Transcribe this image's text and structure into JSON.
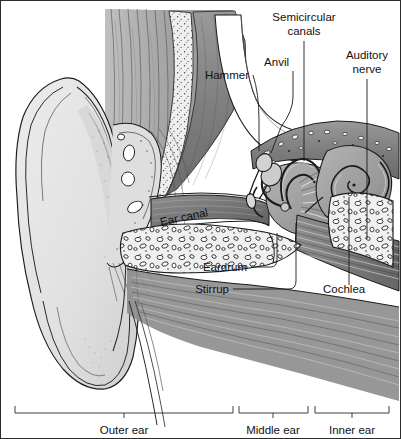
{
  "figure": {
    "background_color": "#ffffff",
    "border_color": "#2b2b2b",
    "ink_color": "#1b1b1b",
    "width": 401,
    "height": 439
  },
  "labels": [
    {
      "id": "hammer",
      "text": "Hammer",
      "x": 248,
      "y": 78,
      "anchor": "end"
    },
    {
      "id": "anvil",
      "text": "Anvil",
      "x": 288,
      "y": 65,
      "anchor": "end"
    },
    {
      "id": "semicircular_line1",
      "text": "Semicircular",
      "x": 303,
      "y": 20,
      "anchor": "middle"
    },
    {
      "id": "semicircular_line2",
      "text": "canals",
      "x": 303,
      "y": 34,
      "anchor": "middle"
    },
    {
      "id": "auditory_line1",
      "text": "Auditory",
      "x": 366,
      "y": 58,
      "anchor": "middle"
    },
    {
      "id": "auditory_line2",
      "text": "nerve",
      "x": 366,
      "y": 72,
      "anchor": "middle"
    },
    {
      "id": "ear_canal",
      "text": "Ear canal",
      "x": 160,
      "y": 225,
      "anchor": "start",
      "rotate": -12
    },
    {
      "id": "eardrum",
      "text": "Eardrum",
      "x": 246,
      "y": 270,
      "anchor": "end"
    },
    {
      "id": "stirrup",
      "text": "Stirrup",
      "x": 228,
      "y": 292,
      "anchor": "end"
    },
    {
      "id": "cochlea",
      "text": "Cochlea",
      "x": 322,
      "y": 292,
      "anchor": "start"
    }
  ],
  "regions": [
    {
      "id": "outer_ear",
      "text": "Outer ear",
      "x1": 14,
      "x2": 232,
      "label_x": 123,
      "label_y": 433
    },
    {
      "id": "middle_ear",
      "text": "Middle ear",
      "x1": 238,
      "x2": 307,
      "label_x": 272,
      "label_y": 433
    },
    {
      "id": "inner_ear",
      "text": "Inner ear",
      "x1": 314,
      "x2": 388,
      "label_x": 351,
      "label_y": 433
    }
  ],
  "bracket": {
    "baseline_y": 412,
    "cap_height": 7,
    "tick_height": 5
  },
  "parts": {
    "pinna": "outer ear flap",
    "lobe": "ear lobe",
    "canal": "ear canal passage",
    "eardrum": "tympanic membrane",
    "ossicles": "hammer, anvil, stirrup",
    "cochlea": "spiral cochlea",
    "semicircular_canals": "three loops",
    "auditory_nerve": "nerve bundle",
    "bone": "cancellous temporal bone"
  }
}
